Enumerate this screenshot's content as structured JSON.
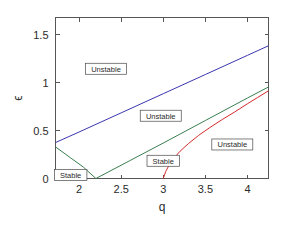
{
  "chart_data": {
    "type": "line",
    "title": "",
    "xlabel": "q",
    "ylabel": "ϵ",
    "xlim": [
      1.72,
      4.25
    ],
    "ylim": [
      0,
      1.68
    ],
    "xticks": [
      2,
      2.5,
      3,
      3.5,
      4
    ],
    "xtick_labels": [
      "2",
      "2.5",
      "3",
      "3.5",
      "4"
    ],
    "yticks": [
      0,
      0.5,
      1,
      1.5
    ],
    "ytick_labels": [
      "0",
      "0.5",
      "1",
      "1.5"
    ],
    "grid": false,
    "legend": "none",
    "series": [
      {
        "name": "upper-boundary",
        "color": "#3a35b0",
        "points": [
          [
            1.72,
            0.375
          ],
          [
            2.0,
            0.485
          ],
          [
            2.2,
            0.565
          ],
          [
            2.5,
            0.685
          ],
          [
            3.0,
            0.885
          ],
          [
            3.5,
            1.085
          ],
          [
            4.0,
            1.285
          ],
          [
            4.25,
            1.385
          ]
        ]
      },
      {
        "name": "stable-wedge-left",
        "color": "#3a7f4f",
        "points": [
          [
            1.72,
            0.33
          ],
          [
            1.9,
            0.215
          ],
          [
            2.05,
            0.12
          ],
          [
            2.2,
            0.0
          ]
        ]
      },
      {
        "name": "stable-wedge-right",
        "color": "#3a7f4f",
        "points": [
          [
            2.2,
            0.0
          ],
          [
            2.6,
            0.185
          ],
          [
            3.0,
            0.37
          ],
          [
            3.5,
            0.605
          ],
          [
            4.0,
            0.84
          ],
          [
            4.25,
            0.955
          ]
        ]
      },
      {
        "name": "red-boundary",
        "color": "#d42a2a",
        "points": [
          [
            3.0,
            0.0
          ],
          [
            3.03,
            0.075
          ],
          [
            3.07,
            0.14
          ],
          [
            3.12,
            0.205
          ],
          [
            3.2,
            0.285
          ],
          [
            3.3,
            0.365
          ],
          [
            3.42,
            0.45
          ],
          [
            3.55,
            0.53
          ],
          [
            3.7,
            0.615
          ],
          [
            3.85,
            0.695
          ],
          [
            4.0,
            0.78
          ],
          [
            4.12,
            0.845
          ],
          [
            4.25,
            0.915
          ]
        ]
      }
    ],
    "annotations": [
      {
        "label": "Unstable",
        "x": 2.32,
        "y": 1.145,
        "name": "region-label-unstable-top"
      },
      {
        "label": "Unstable",
        "x": 2.97,
        "y": 0.655,
        "name": "region-label-unstable-middle"
      },
      {
        "label": "Unstable",
        "x": 3.82,
        "y": 0.355,
        "name": "region-label-unstable-right"
      },
      {
        "label": "Stable",
        "x": 3.0,
        "y": 0.185,
        "name": "region-label-stable-wedge"
      },
      {
        "label": "Stable",
        "x": 1.9,
        "y": 0.038,
        "name": "region-label-stable-corner"
      }
    ]
  }
}
